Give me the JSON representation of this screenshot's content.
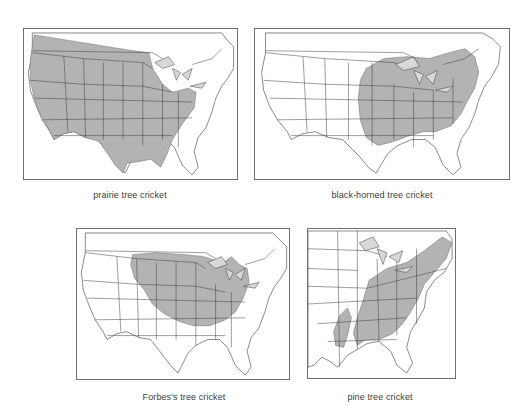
{
  "figure": {
    "panels": [
      {
        "id": "prairie",
        "caption": "prairie tree cricket",
        "extent": "full-us",
        "range_description": "Western and central United States: Pacific coast states east to Mississippi/Ohio valley, Texas, Tennessee and Kentucky, southern Canadian border"
      },
      {
        "id": "black-horned",
        "caption": "black-horned tree cricket",
        "extent": "full-us",
        "range_description": "Northeastern and Great Lakes region: Iowa/Missouri east to New England, south to Kentucky/Virginia"
      },
      {
        "id": "forbes",
        "caption": "Forbes's tree cricket",
        "extent": "full-us",
        "range_description": "Northern Great Plains and Midwest: Montana/Dakotas east to Ohio and Michigan, south to Kansas/Missouri"
      },
      {
        "id": "pine",
        "caption": "pine tree cricket",
        "extent": "eastern-us",
        "range_description": "Eastern United States: Maine south to Georgia/Alabama/Mississippi, with isolated patch in Louisiana/east Texas"
      }
    ],
    "colors": {
      "range_fill": "#b3b3b3",
      "outline": "#3c3c3c",
      "frame": "#6e6e6e",
      "caption_text": "#3c3c3c",
      "background": "#ffffff"
    }
  }
}
